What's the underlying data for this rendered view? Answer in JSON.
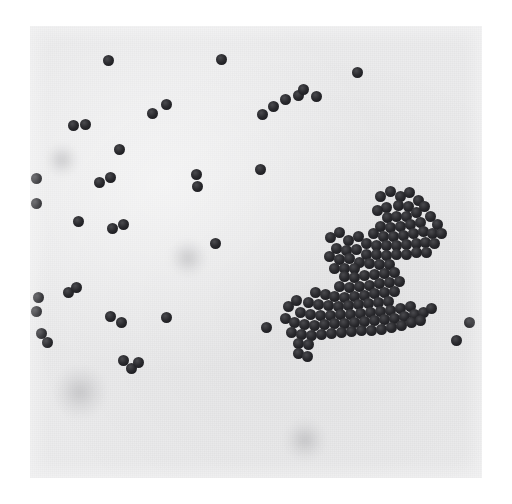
{
  "image": {
    "kind": "photomicrograph",
    "subject": "gram-stain-cocci",
    "caption_visible": "",
    "canvas": {
      "width": 512,
      "height": 504
    },
    "border_color": "#ffffff",
    "photo": {
      "x": 30,
      "y": 26,
      "width": 452,
      "height": 452
    },
    "colors": {
      "background_paper": "#ffffff",
      "print_field": "#ececed",
      "cell_dark": "#1f1f24",
      "cell_highlight": "#4a4a4e",
      "smudge_gray": "#8a8a8f"
    },
    "cell_diameter_px": 11,
    "counts": {
      "isolated_and_paired": 42,
      "cluster_upper_right": 61,
      "cluster_lower_right": 78
    },
    "smudges": [
      {
        "x": 80,
        "y": 392,
        "r": 26
      },
      {
        "x": 305,
        "y": 440,
        "r": 20
      },
      {
        "x": 62,
        "y": 160,
        "r": 16
      },
      {
        "x": 188,
        "y": 258,
        "r": 18
      }
    ],
    "scattered_cells": [
      [
        108,
        60,
        11
      ],
      [
        73,
        125,
        11
      ],
      [
        85,
        124,
        11
      ],
      [
        152,
        113,
        11
      ],
      [
        166,
        104,
        11
      ],
      [
        119,
        149,
        11
      ],
      [
        221,
        59,
        11
      ],
      [
        196,
        174,
        11
      ],
      [
        197,
        186,
        11
      ],
      [
        260,
        169,
        11
      ],
      [
        262,
        114,
        11
      ],
      [
        273,
        106,
        11
      ],
      [
        285,
        99,
        11
      ],
      [
        298,
        95,
        11
      ],
      [
        303,
        89,
        11
      ],
      [
        316,
        96,
        11
      ],
      [
        357,
        72,
        11
      ],
      [
        36,
        203,
        11
      ],
      [
        99,
        182,
        11
      ],
      [
        110,
        177,
        11
      ],
      [
        78,
        221,
        11
      ],
      [
        112,
        228,
        11
      ],
      [
        123,
        224,
        11
      ],
      [
        215,
        243,
        11
      ],
      [
        166,
        317,
        11
      ],
      [
        38,
        297,
        11
      ],
      [
        68,
        292,
        11
      ],
      [
        76,
        287,
        11
      ],
      [
        41,
        333,
        11
      ],
      [
        47,
        342,
        11
      ],
      [
        110,
        316,
        11
      ],
      [
        121,
        322,
        11
      ],
      [
        123,
        360,
        11
      ],
      [
        131,
        368,
        11
      ],
      [
        138,
        362,
        11
      ],
      [
        266,
        327,
        11
      ],
      [
        469,
        322,
        11
      ],
      [
        456,
        340,
        11
      ],
      [
        36,
        178,
        11
      ],
      [
        36,
        311,
        11
      ]
    ],
    "cluster_upper_cells": [
      [
        380,
        196
      ],
      [
        390,
        191
      ],
      [
        400,
        196
      ],
      [
        409,
        192
      ],
      [
        398,
        205
      ],
      [
        408,
        206
      ],
      [
        418,
        200
      ],
      [
        386,
        207
      ],
      [
        377,
        210
      ],
      [
        387,
        217
      ],
      [
        396,
        216
      ],
      [
        406,
        216
      ],
      [
        416,
        212
      ],
      [
        424,
        206
      ],
      [
        380,
        226
      ],
      [
        390,
        227
      ],
      [
        400,
        226
      ],
      [
        410,
        224
      ],
      [
        420,
        222
      ],
      [
        430,
        216
      ],
      [
        437,
        224
      ],
      [
        373,
        233
      ],
      [
        383,
        236
      ],
      [
        393,
        236
      ],
      [
        403,
        235
      ],
      [
        413,
        233
      ],
      [
        423,
        231
      ],
      [
        432,
        233
      ],
      [
        441,
        233
      ],
      [
        330,
        237
      ],
      [
        339,
        232
      ],
      [
        348,
        240
      ],
      [
        358,
        236
      ],
      [
        366,
        243
      ],
      [
        376,
        245
      ],
      [
        386,
        245
      ],
      [
        396,
        245
      ],
      [
        406,
        244
      ],
      [
        416,
        243
      ],
      [
        425,
        242
      ],
      [
        434,
        243
      ],
      [
        426,
        252
      ],
      [
        416,
        252
      ],
      [
        336,
        248
      ],
      [
        346,
        250
      ],
      [
        356,
        249
      ],
      [
        366,
        254
      ],
      [
        376,
        254
      ],
      [
        386,
        255
      ],
      [
        396,
        254
      ],
      [
        406,
        254
      ],
      [
        329,
        256
      ],
      [
        339,
        259
      ],
      [
        349,
        258
      ],
      [
        359,
        262
      ],
      [
        369,
        263
      ],
      [
        379,
        264
      ],
      [
        389,
        264
      ],
      [
        334,
        268
      ],
      [
        344,
        268
      ],
      [
        354,
        268
      ]
    ],
    "cluster_lower_cells": [
      [
        344,
        276
      ],
      [
        354,
        277
      ],
      [
        364,
        275
      ],
      [
        374,
        274
      ],
      [
        384,
        273
      ],
      [
        394,
        272
      ],
      [
        339,
        286
      ],
      [
        349,
        287
      ],
      [
        359,
        286
      ],
      [
        369,
        285
      ],
      [
        379,
        283
      ],
      [
        389,
        282
      ],
      [
        399,
        281
      ],
      [
        315,
        292
      ],
      [
        325,
        294
      ],
      [
        334,
        296
      ],
      [
        344,
        297
      ],
      [
        354,
        296
      ],
      [
        364,
        295
      ],
      [
        374,
        293
      ],
      [
        384,
        292
      ],
      [
        394,
        291
      ],
      [
        308,
        302
      ],
      [
        318,
        304
      ],
      [
        328,
        305
      ],
      [
        338,
        306
      ],
      [
        348,
        305
      ],
      [
        358,
        304
      ],
      [
        368,
        303
      ],
      [
        378,
        302
      ],
      [
        388,
        301
      ],
      [
        288,
        306
      ],
      [
        296,
        300
      ],
      [
        300,
        312
      ],
      [
        310,
        314
      ],
      [
        320,
        315
      ],
      [
        330,
        315
      ],
      [
        340,
        314
      ],
      [
        350,
        314
      ],
      [
        360,
        313
      ],
      [
        370,
        312
      ],
      [
        380,
        311
      ],
      [
        390,
        310
      ],
      [
        400,
        308
      ],
      [
        410,
        306
      ],
      [
        285,
        318
      ],
      [
        294,
        322
      ],
      [
        304,
        324
      ],
      [
        314,
        325
      ],
      [
        324,
        324
      ],
      [
        334,
        323
      ],
      [
        344,
        323
      ],
      [
        354,
        322
      ],
      [
        364,
        321
      ],
      [
        374,
        320
      ],
      [
        384,
        319
      ],
      [
        394,
        318
      ],
      [
        404,
        316
      ],
      [
        414,
        314
      ],
      [
        423,
        312
      ],
      [
        431,
        308
      ],
      [
        291,
        332
      ],
      [
        301,
        334
      ],
      [
        311,
        335
      ],
      [
        321,
        334
      ],
      [
        331,
        333
      ],
      [
        341,
        332
      ],
      [
        351,
        331
      ],
      [
        361,
        330
      ],
      [
        371,
        330
      ],
      [
        381,
        329
      ],
      [
        391,
        327
      ],
      [
        401,
        325
      ],
      [
        411,
        322
      ],
      [
        420,
        320
      ],
      [
        298,
        343
      ],
      [
        308,
        344
      ],
      [
        298,
        353
      ],
      [
        307,
        356
      ]
    ]
  }
}
